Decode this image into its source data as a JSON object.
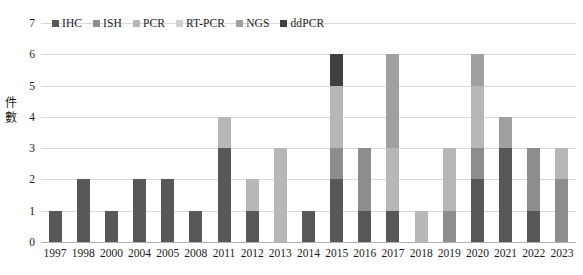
{
  "chart_data": {
    "type": "bar",
    "subtype": "stacked-vertical",
    "title": "",
    "xlabel": "",
    "ylabel": "件數",
    "ylim": [
      0,
      7
    ],
    "yticks": [
      0,
      1,
      2,
      3,
      4,
      5,
      6,
      7
    ],
    "ytick_labels": [
      "0",
      "1",
      "2",
      "3",
      "4",
      "5",
      "6",
      "7"
    ],
    "grid": true,
    "legend_position": "top-left",
    "categories": [
      "1997",
      "1998",
      "2000",
      "2004",
      "2005",
      "2008",
      "2011",
      "2012",
      "2013",
      "2014",
      "2015",
      "2016",
      "2017",
      "2018",
      "2019",
      "2020",
      "2021",
      "2022",
      "2023"
    ],
    "series": [
      {
        "name": "IHC",
        "color": "#585858",
        "values": [
          1,
          2,
          1,
          2,
          2,
          1,
          3,
          1,
          0,
          1,
          2,
          1,
          1,
          0,
          0,
          2,
          3,
          1,
          0
        ]
      },
      {
        "name": "ISH",
        "color": "#8d8d8d",
        "values": [
          0,
          0,
          0,
          0,
          0,
          0,
          0,
          0,
          0,
          0,
          1,
          2,
          0,
          0,
          1,
          1,
          0,
          2,
          2
        ]
      },
      {
        "name": "PCR",
        "color": "#b7b7b7",
        "values": [
          0,
          0,
          0,
          0,
          0,
          0,
          1,
          1,
          3,
          0,
          2,
          0,
          2,
          1,
          2,
          2,
          0,
          0,
          1
        ]
      },
      {
        "name": "RT-PCR",
        "color": "#d0d0d0",
        "values": [
          0,
          0,
          0,
          0,
          0,
          0,
          0,
          0,
          0,
          0,
          0,
          0,
          0,
          0,
          0,
          0,
          0,
          0,
          0
        ]
      },
      {
        "name": "NGS",
        "color": "#a0a0a0",
        "values": [
          0,
          0,
          0,
          0,
          0,
          0,
          0,
          0,
          0,
          0,
          0,
          0,
          3,
          0,
          0,
          1,
          1,
          0,
          0
        ]
      },
      {
        "name": "ddPCR",
        "color": "#404040",
        "values": [
          0,
          0,
          0,
          0,
          0,
          0,
          0,
          0,
          0,
          0,
          1,
          0,
          0,
          0,
          0,
          0,
          0,
          0,
          0
        ]
      }
    ],
    "totals": [
      1,
      2,
      1,
      2,
      2,
      1,
      4,
      2,
      3,
      1,
      6,
      3,
      6,
      1,
      3,
      6,
      4,
      3,
      3
    ]
  },
  "legend": {
    "items": [
      {
        "label": "IHC"
      },
      {
        "label": "ISH"
      },
      {
        "label": "PCR"
      },
      {
        "label": "RT-PCR"
      },
      {
        "label": "NGS"
      },
      {
        "label": "ddPCR"
      }
    ]
  },
  "axis": {
    "y_title_chars": [
      "件",
      "數"
    ]
  },
  "colors": {
    "gridline": "#d9d9d9",
    "axis": "#b0b0b0",
    "text": "#1a1a1a",
    "background": "#ffffff"
  }
}
